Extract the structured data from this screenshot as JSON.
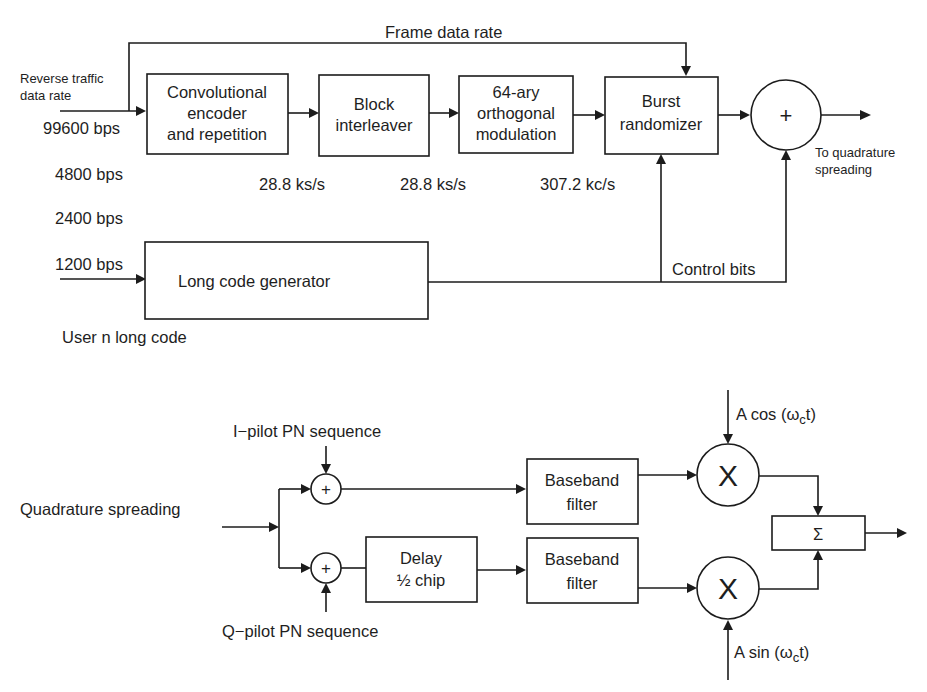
{
  "colors": {
    "line": "#1c1c1c",
    "text": "#1e1e1e",
    "background": "#ffffff"
  },
  "top": {
    "input_label": [
      "Reverse traffic",
      "data rate"
    ],
    "frame_rate_label": "Frame data rate",
    "rates": [
      "99600 bps",
      "4800 bps",
      "2400 bps",
      "1200 bps"
    ],
    "blocks": {
      "conv_encoder": [
        "Convolutional",
        "encoder",
        "and repetition"
      ],
      "interleaver": [
        "Block",
        "interleaver"
      ],
      "orth_mod": [
        "64-ary",
        "orthogonal",
        "modulation"
      ],
      "burst_rand": [
        "Burst",
        "randomizer"
      ],
      "long_code": "Long code generator"
    },
    "symbol_rates": [
      "28.8 ks/s",
      "28.8 ks/s",
      "307.2 kc/s"
    ],
    "summer_symbol": "+",
    "output_label": [
      "To quadrature",
      "spreading"
    ],
    "control_bits": "Control bits",
    "long_code_input": "User n long code"
  },
  "bottom": {
    "input_label": "Quadrature spreading",
    "i_pilot": "I−pilot PN sequence",
    "q_pilot": "Q−pilot PN sequence",
    "adder_symbol": "+",
    "delay_block": [
      "Delay",
      "½ chip"
    ],
    "filter_block": [
      "Baseband",
      "filter"
    ],
    "mixer_symbol": "X",
    "cos_carrier": {
      "prefix": "A cos (",
      "omega": "ω",
      "sub": "c",
      "suffix": "t)"
    },
    "sin_carrier": {
      "prefix": "A sin (",
      "omega": "ω",
      "sub": "c",
      "suffix": "t)"
    },
    "sum_symbol": "Σ"
  }
}
